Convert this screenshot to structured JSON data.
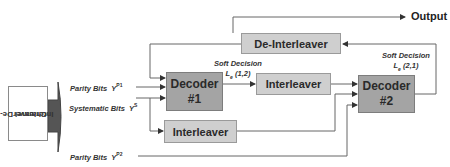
{
  "diagram": {
    "colors": {
      "decoder_fill": "#a4a4a4",
      "interleaver_fill": "#cfcfcf",
      "line": "#555555",
      "channel_arrow": "#555555"
    },
    "blocks": {
      "channel_deinterleaver": {
        "line1": "Channel De-",
        "line2": "Interleaver"
      },
      "decoder1": {
        "line1": "Decoder",
        "line2": "#1"
      },
      "decoder2": {
        "line1": "Decoder",
        "line2": "#2"
      },
      "interleaver_mid": {
        "label": "Interleaver"
      },
      "interleaver_low": {
        "label": "Interleaver"
      },
      "deinterleaver": {
        "label": "De-Interleaver"
      }
    },
    "inputs": {
      "parity1": {
        "label": "Parity Bits",
        "symbol": "Y",
        "sup": "P1"
      },
      "systematic": {
        "label": "Systematic Bits",
        "symbol": "Y",
        "sup": "S"
      },
      "parity2": {
        "label": "Parity Bits",
        "symbol": "Y",
        "sup": "P2"
      }
    },
    "soft_decisions": {
      "sd12": {
        "title": "Soft Decision",
        "symbol": "L",
        "sub": "e",
        "args": "(1,2)"
      },
      "sd21": {
        "title": "Soft Decision",
        "symbol": "L",
        "sub": "e",
        "args": "(2,1)"
      }
    },
    "output": {
      "label": "Output"
    }
  }
}
